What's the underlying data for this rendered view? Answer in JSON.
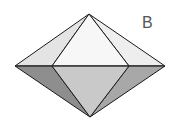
{
  "figure": {
    "label": "B",
    "shape": "bipyramid",
    "vertices": {
      "top": [
        89,
        14
      ],
      "bottom": [
        90,
        117
      ],
      "left": [
        15,
        66
      ],
      "right": [
        165,
        66
      ],
      "front_left": [
        52,
        66
      ],
      "front_right": [
        129,
        66
      ]
    },
    "colors": {
      "stroke": "#1a1a1a",
      "top_left_face": "#e4e4e4",
      "top_front_face": "#f7f7f7",
      "top_right_face": "#eeeeee",
      "bottom_left_face": "#8e8e8e",
      "bottom_front_face": "#c9c9c9",
      "bottom_right_face": "#a8a8a8"
    }
  }
}
